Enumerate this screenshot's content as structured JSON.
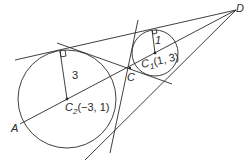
{
  "diagram": {
    "type": "geometry",
    "points": {
      "A": {
        "label": "A"
      },
      "C": {
        "label": "C"
      },
      "D": {
        "label": "D"
      }
    },
    "circles": [
      {
        "name": "C1",
        "label_main": "C",
        "label_sub": "1",
        "label_coords": "(1, 3)",
        "radius_label": "1"
      },
      {
        "name": "C2",
        "label_main": "C",
        "label_sub": "2",
        "label_coords": "(−3, 1)",
        "radius_label": "3"
      }
    ],
    "colors": {
      "stroke": "#2a2a2a",
      "background": "#ffffff"
    }
  }
}
